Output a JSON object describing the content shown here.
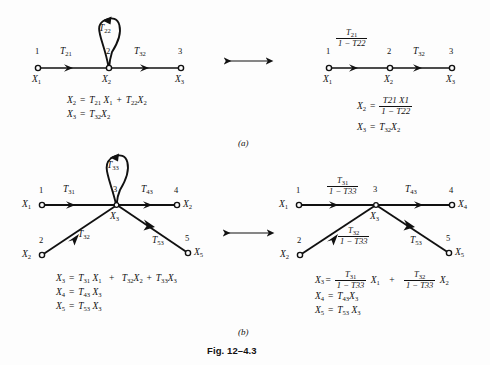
{
  "figure": {
    "caption": "Fig. 12–4.3",
    "part_a_label": "(a)",
    "part_b_label": "(b)"
  },
  "symbols": {
    "equiv_arrow": "double-headed-arrow",
    "minus": "−",
    "plus": "+",
    "equals": "=",
    "X": "X",
    "T": "T",
    "one": "1"
  },
  "part_a": {
    "left_graph": {
      "nodes": [
        {
          "index": "1",
          "var": "X",
          "var_sub": "1"
        },
        {
          "index": "2",
          "var": "X",
          "var_sub": "2"
        },
        {
          "index": "3",
          "var": "X",
          "var_sub": "3"
        }
      ],
      "edges": [
        {
          "label_base": "T",
          "label_sub": "21",
          "from": "1",
          "to": "2"
        },
        {
          "label_base": "T",
          "label_sub": "32",
          "from": "2",
          "to": "3"
        }
      ],
      "self_loop": {
        "label_base": "T",
        "label_sub": "22",
        "at_node": "2"
      },
      "equations": [
        {
          "lhs": "X",
          "lhs_sub": "2",
          "terms": [
            "T21 X1",
            "T22 X2"
          ]
        },
        {
          "lhs": "X",
          "lhs_sub": "3",
          "terms": [
            "T32 X2"
          ]
        }
      ]
    },
    "right_graph": {
      "nodes": [
        {
          "index": "1",
          "var": "X",
          "var_sub": "1"
        },
        {
          "index": "2",
          "var": "X",
          "var_sub": "2"
        },
        {
          "index": "3",
          "var": "X",
          "var_sub": "3"
        }
      ],
      "edges": [
        {
          "num_base": "T",
          "num_sub": "21",
          "den": "1 − T22",
          "from": "1",
          "to": "2"
        },
        {
          "label_base": "T",
          "label_sub": "32",
          "from": "2",
          "to": "3"
        }
      ],
      "equations": [
        {
          "lhs": "X",
          "lhs_sub": "2",
          "num": "T21 X1",
          "den": "1 − T22"
        },
        {
          "lhs": "X",
          "lhs_sub": "3",
          "terms": [
            "T32 X2"
          ]
        }
      ]
    }
  },
  "part_b": {
    "left_graph": {
      "nodes": [
        {
          "index": "1",
          "var": "X",
          "var_sub": "1"
        },
        {
          "index": "2",
          "var": "X",
          "var_sub": "2"
        },
        {
          "index": "3",
          "var": "X",
          "var_sub": "3"
        },
        {
          "index": "4",
          "var": "X",
          "var_sub": "2"
        },
        {
          "index": "5",
          "var": "X",
          "var_sub": "5"
        }
      ],
      "edges": [
        {
          "label_base": "T",
          "label_sub": "31",
          "from": "1",
          "to": "3"
        },
        {
          "label_base": "T",
          "label_sub": "32",
          "from": "2",
          "to": "3"
        },
        {
          "label_base": "T",
          "label_sub": "43",
          "from": "3",
          "to": "4"
        },
        {
          "label_base": "T",
          "label_sub": "53",
          "from": "3",
          "to": "5"
        }
      ],
      "self_loop": {
        "label_base": "T",
        "label_sub": "33",
        "at_node": "3"
      },
      "equations": [
        {
          "lhs": "X",
          "lhs_sub": "3",
          "terms": [
            "T31 X1",
            "T32 X2",
            "T33 X3"
          ]
        },
        {
          "lhs": "X",
          "lhs_sub": "4",
          "terms": [
            "T43 X3"
          ]
        },
        {
          "lhs": "X",
          "lhs_sub": "5",
          "terms": [
            "T53 X3"
          ]
        }
      ]
    },
    "right_graph": {
      "nodes": [
        {
          "index": "1",
          "var": "X",
          "var_sub": "1"
        },
        {
          "index": "2",
          "var": "X",
          "var_sub": "2"
        },
        {
          "index": "3",
          "var": "X",
          "var_sub": "3"
        },
        {
          "index": "4",
          "var": "X",
          "var_sub": "4"
        },
        {
          "index": "5",
          "var": "X",
          "var_sub": "5"
        }
      ],
      "edges": [
        {
          "num_base": "T",
          "num_sub": "31",
          "den": "1 − T33",
          "from": "1",
          "to": "3"
        },
        {
          "num_base": "T",
          "num_sub": "32",
          "den": "1 − T33",
          "from": "2",
          "to": "3"
        },
        {
          "label_base": "T",
          "label_sub": "43",
          "from": "3",
          "to": "4"
        },
        {
          "label_base": "T",
          "label_sub": "53",
          "from": "3",
          "to": "5"
        }
      ],
      "equations": [
        {
          "lhs": "X",
          "lhs_sub": "3",
          "term1_num": "T31",
          "term1_den": "1 − T33",
          "term1_var": "X1",
          "term2_num": "T32",
          "term2_den": "1 − T33",
          "term2_var": "X2"
        },
        {
          "lhs": "X",
          "lhs_sub": "4",
          "terms": [
            "T43 X3"
          ]
        },
        {
          "lhs": "X",
          "lhs_sub": "5",
          "terms": [
            "T53 X3"
          ]
        }
      ]
    }
  },
  "text": {
    "T": "T",
    "s21": "21",
    "s22": "22",
    "s31": "31",
    "s32": "32",
    "s33": "33",
    "s43": "43",
    "s53": "53",
    "n1": "1",
    "n2": "2",
    "n3": "3",
    "n4": "4",
    "n5": "5"
  },
  "colors": {
    "ink": "#111111",
    "background": "#fdfdfd"
  }
}
